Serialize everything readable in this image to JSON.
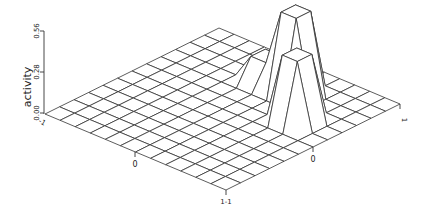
{
  "chart_data": {
    "type": "surface3d",
    "title": "",
    "zlabel": "activity",
    "z_ticks": [
      {
        "value": 0.0,
        "label": "0.00"
      },
      {
        "value": 0.28,
        "label": "0.28"
      },
      {
        "value": 0.56,
        "label": "0.56"
      }
    ],
    "zlim": [
      0,
      0.56
    ],
    "x_axis": {
      "range": [
        -1,
        1
      ],
      "tick_labels": [
        {
          "value": -1,
          "label": "-1"
        },
        {
          "value": 0,
          "label": "0"
        },
        {
          "value": 1,
          "label": "1"
        }
      ]
    },
    "y_axis": {
      "range": [
        -1,
        1
      ],
      "tick_labels": [
        {
          "value": -1,
          "label": "-1"
        },
        {
          "value": 0,
          "label": "0"
        },
        {
          "value": 1,
          "label": "1"
        }
      ]
    },
    "grid_cells": 12,
    "peaks": [
      {
        "name": "tall-peak",
        "i": 7,
        "j": 9,
        "height": 0.56,
        "description": "tallest plateau at back right"
      },
      {
        "name": "front-peak",
        "i": 9,
        "j": 7,
        "height": 0.45,
        "description": "second plateau in front of tall peak"
      },
      {
        "name": "small-bump",
        "i": 5,
        "j": 9,
        "height": 0.17,
        "description": "small bump near back"
      }
    ],
    "grid_on": true,
    "legend": null
  },
  "labels": {
    "zlabel": "activity",
    "z0": "0.00",
    "z1": "0.28",
    "z2": "0.56",
    "left_minus1": "-1",
    "left_zero": "0",
    "front_corner": "1-1",
    "right_zero": "0",
    "right_one": "1"
  }
}
